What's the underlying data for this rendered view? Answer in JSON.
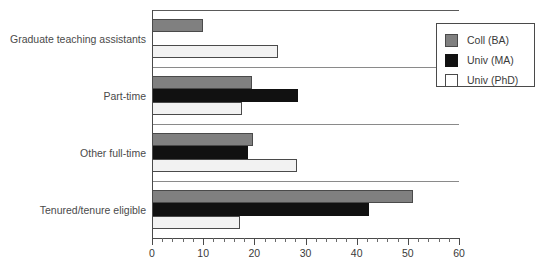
{
  "chart_data": {
    "type": "bar",
    "orientation": "horizontal",
    "title": "",
    "xlabel": "",
    "ylabel": "",
    "xlim": [
      0,
      60
    ],
    "grid": false,
    "legend_position": "top-right",
    "x_major_step": 10,
    "x_minor_step": 2,
    "categories": [
      "Graduate teaching assistants",
      "Part-time",
      "Other full-time",
      "Tenured/tenure eligible"
    ],
    "x_tick_labels": [
      "0",
      "10",
      "20",
      "30",
      "40",
      "50",
      "60"
    ],
    "x_tick_values": [
      0,
      10,
      20,
      30,
      40,
      50,
      60
    ],
    "series": [
      {
        "name": "Coll (BA)",
        "color": "#808080",
        "values": [
          10,
          19.5,
          19.7,
          51
        ]
      },
      {
        "name": "Univ (MA)",
        "color": "#111111",
        "values": [
          0,
          28.5,
          18.8,
          42.4
        ]
      },
      {
        "name": "Univ (PhD)",
        "color": "#ffffff",
        "values": [
          24.6,
          17.6,
          28.3,
          17.2
        ]
      }
    ]
  },
  "legend": {
    "entries": [
      {
        "label": "Coll (BA)",
        "swatch": "coll"
      },
      {
        "label": "Univ (MA)",
        "swatch": "univma"
      },
      {
        "label": "Univ (PhD)",
        "swatch": "univphd"
      }
    ]
  },
  "colors": {
    "coll_ba": "#808080",
    "univ_ma": "#111111",
    "univ_phd": "#ffffff",
    "axis": "#4a4a4a",
    "text": "#3a3a3a",
    "separator": "#8a8a8a",
    "background": "#ffffff"
  }
}
